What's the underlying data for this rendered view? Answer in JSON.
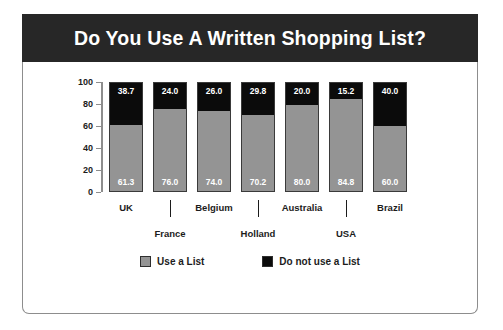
{
  "header": {
    "title": "Do You Use A Written Shopping List?",
    "background_color": "#272727",
    "text_color": "#ffffff"
  },
  "colors": {
    "use_a_list": "#949494",
    "do_not_use_a_list": "#0b0b0b",
    "frame": "#8d8d8d",
    "text": "#1c1c1c"
  },
  "legend": {
    "items": [
      {
        "label": "Use a List",
        "color": "#949494"
      },
      {
        "label": "Do not use a List",
        "color": "#0b0b0b"
      }
    ]
  },
  "axis": {
    "y_ticks": [
      "100",
      "80",
      "60",
      "40",
      "20",
      "0"
    ]
  },
  "chart_data": {
    "type": "bar",
    "title": "Do You Use A Written Shopping List?",
    "xlabel": "",
    "ylabel": "",
    "ylim": [
      0,
      100
    ],
    "yticks": [
      0,
      20,
      40,
      60,
      80,
      100
    ],
    "grid": false,
    "stacked": true,
    "legend_position": "bottom",
    "categories": [
      "UK",
      "France",
      "Belgium",
      "Holland",
      "Australia",
      "USA",
      "Brazil"
    ],
    "series": [
      {
        "name": "Use a List",
        "color": "#949494",
        "values": [
          61.3,
          76.0,
          74.0,
          70.2,
          80.0,
          84.8,
          60.0
        ],
        "labels": [
          "61.3",
          "76.0",
          "74.0",
          "70.2",
          "80.0",
          "84.8",
          "60.0"
        ]
      },
      {
        "name": "Do not use a List",
        "color": "#0b0b0b",
        "values": [
          38.7,
          24.0,
          26.0,
          29.8,
          20.0,
          15.2,
          40.0
        ],
        "labels": [
          "38.7",
          "24.0",
          "26.0",
          "29.8",
          "20.0",
          "15.2",
          "40.0"
        ]
      }
    ],
    "category_label_rows": [
      "top",
      "bottom",
      "top",
      "bottom",
      "top",
      "bottom",
      "top"
    ]
  }
}
